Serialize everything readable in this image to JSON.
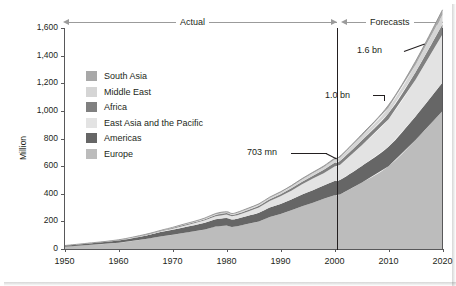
{
  "header": {
    "actual_label": "Actual",
    "forecasts_label": "Forecasts"
  },
  "axis": {
    "y_title": "Million",
    "y_ticks": [
      "1,600",
      "1,400",
      "1,200",
      "1,000",
      "800",
      "600",
      "400",
      "200",
      "0"
    ],
    "x_ticks": [
      "1950",
      "1960",
      "1970",
      "1980",
      "1990",
      "2000",
      "2010",
      "2020"
    ]
  },
  "legend": {
    "items": [
      {
        "label": "South Asia",
        "color": "#a8a8a8"
      },
      {
        "label": "Middle East",
        "color": "#d5d5d5"
      },
      {
        "label": "Africa",
        "color": "#808080"
      },
      {
        "label": "East Asia and the Pacific",
        "color": "#e3e3e3"
      },
      {
        "label": "Americas",
        "color": "#666666"
      },
      {
        "label": "Europe",
        "color": "#bcbcbc"
      }
    ]
  },
  "annotations": {
    "total_2020": "1.6 bn",
    "europe_2020": "1.0 bn",
    "total_2001": "703 mn"
  },
  "chart_data": {
    "type": "area",
    "title": "",
    "xlabel": "",
    "ylabel": "Million",
    "ylim": [
      0,
      1600
    ],
    "xlim": [
      1950,
      2020
    ],
    "grid": false,
    "legend_position": "inside-upper-left",
    "stacked": true,
    "stack_order_bottom_to_top": [
      "Europe",
      "Americas",
      "East Asia and the Pacific",
      "Africa",
      "Middle East",
      "South Asia"
    ],
    "divider_year": 2001,
    "divider_label": "Actual / Forecasts",
    "x": [
      1950,
      1955,
      1960,
      1965,
      1968,
      1970,
      1972,
      1974,
      1976,
      1978,
      1980,
      1981,
      1982,
      1984,
      1986,
      1988,
      1990,
      1992,
      1994,
      1996,
      1998,
      2000,
      2001,
      2005,
      2010,
      2015,
      2020
    ],
    "series": [
      {
        "name": "Europe",
        "values": [
          17,
          30,
          45,
          73,
          92,
          103,
          116,
          128,
          142,
          163,
          170,
          160,
          165,
          182,
          200,
          232,
          253,
          280,
          310,
          335,
          363,
          390,
          395,
          480,
          600,
          790,
          1000
        ]
      },
      {
        "name": "Americas",
        "values": [
          7,
          12,
          16,
          23,
          32,
          36,
          40,
          44,
          48,
          52,
          55,
          53,
          54,
          58,
          62,
          68,
          73,
          78,
          84,
          90,
          96,
          102,
          104,
          120,
          140,
          170,
          205
        ]
      },
      {
        "name": "East Asia and the Pacific",
        "values": [
          0.2,
          1,
          2,
          4,
          6,
          8,
          11,
          14,
          18,
          23,
          25,
          24,
          26,
          32,
          39,
          47,
          55,
          64,
          74,
          85,
          90,
          105,
          110,
          150,
          200,
          265,
          350
        ]
      },
      {
        "name": "Africa",
        "values": [
          0.5,
          1,
          2,
          3,
          4,
          5,
          6,
          7,
          8,
          9,
          10,
          10,
          10,
          11,
          12,
          13,
          15,
          17,
          19,
          21,
          24,
          27,
          28,
          34,
          43,
          55,
          72
        ]
      },
      {
        "name": "Middle East",
        "values": [
          0.2,
          0.5,
          1,
          2,
          2,
          3,
          4,
          5,
          6,
          7,
          7,
          7,
          8,
          9,
          10,
          11,
          13,
          14,
          16,
          17,
          19,
          22,
          23,
          30,
          40,
          53,
          69
        ]
      },
      {
        "name": "South Asia",
        "values": [
          0.1,
          0.2,
          0.5,
          1,
          1,
          1.5,
          2,
          2,
          2.5,
          3,
          3,
          3,
          3,
          3.5,
          4,
          4.5,
          5,
          6,
          7,
          8,
          9,
          10,
          11,
          14,
          19,
          26,
          36
        ]
      }
    ],
    "totals_callouts": [
      {
        "year": 2001,
        "value": 703,
        "label": "703 mn"
      },
      {
        "year": 2020,
        "value": 1600,
        "label": "1.6 bn"
      },
      {
        "year": 2020,
        "value": 1000,
        "label": "1.0 bn",
        "series": "Europe"
      }
    ]
  },
  "colors": {
    "frame": "#58585a",
    "divider": "#231f20",
    "header_rule": "#9b9b9b",
    "outline": "#8a8a8a",
    "text": "#231f20"
  }
}
